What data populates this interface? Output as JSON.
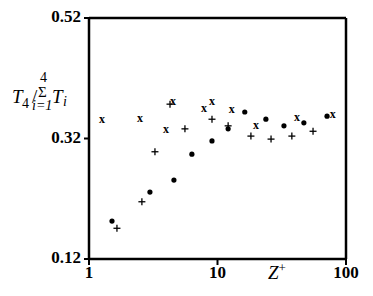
{
  "chart_data": {
    "type": "scatter",
    "title": "",
    "xlabel": "Z+",
    "ylabel": "T4 / Σ(i=1..4) Ti",
    "xscale": "log",
    "xlim": [
      1,
      100
    ],
    "ylim": [
      0.12,
      0.52
    ],
    "x_tick_labels": [
      "1",
      "10",
      "100"
    ],
    "x_ticks": [
      1,
      10,
      100
    ],
    "y_tick_labels": [
      "0.12",
      "0.32",
      "0.52"
    ],
    "y_ticks": [
      0.12,
      0.32,
      0.52
    ],
    "grid": false,
    "legend": "none",
    "series": [
      {
        "name": "x-markers",
        "marker": "x",
        "x": [
          1.26,
          2.49,
          3.97,
          4.51,
          7.85,
          9.06,
          12.9,
          19.9,
          41.5,
          78.8
        ],
        "y": [
          0.352,
          0.354,
          0.336,
          0.382,
          0.371,
          0.382,
          0.369,
          0.342,
          0.356,
          0.361
        ]
      },
      {
        "name": "plus-markers",
        "marker": "+",
        "x": [
          1.65,
          2.58,
          3.26,
          4.27,
          5.58,
          9.06,
          12.1,
          18.2,
          26.1,
          37.9,
          55.4
        ],
        "y": [
          0.171,
          0.215,
          0.298,
          0.377,
          0.336,
          0.352,
          0.341,
          0.324,
          0.319,
          0.324,
          0.332
        ]
      },
      {
        "name": "dot-markers",
        "marker": "dot",
        "x": [
          1.51,
          2.98,
          4.58,
          6.32,
          9.06,
          12.1,
          16.3,
          23.8,
          32.9,
          47.0,
          71.2
        ],
        "y": [
          0.183,
          0.231,
          0.251,
          0.294,
          0.316,
          0.336,
          0.364,
          0.352,
          0.341,
          0.346,
          0.357
        ]
      }
    ]
  },
  "labels": {
    "ylabel_main": "T",
    "ylabel_sub": "4",
    "ylabel_slash": "/",
    "ylabel_sum": "Σ",
    "ylabel_sum_top": "4",
    "ylabel_sum_bottom": "i=1",
    "ylabel_T": "T",
    "ylabel_i": "i",
    "xlabel_main": "Z",
    "xlabel_sup": "+"
  }
}
